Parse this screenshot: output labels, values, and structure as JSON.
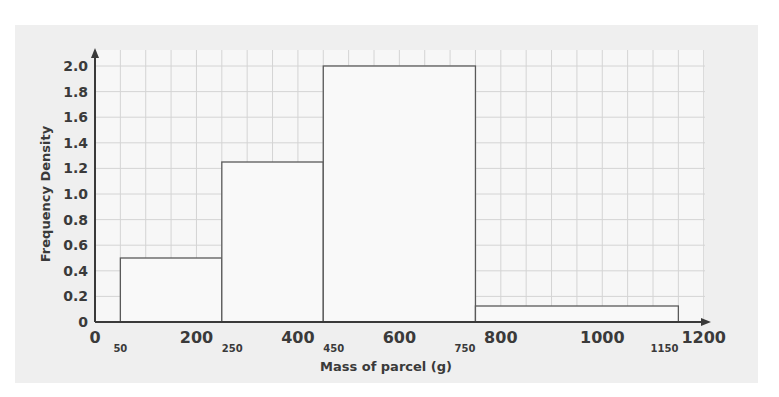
{
  "chart_data": {
    "type": "bar",
    "subtype": "histogram",
    "title": "",
    "xlabel": "Mass of parcel (g)",
    "ylabel": "Frequency Density",
    "xlim": [
      0,
      1200
    ],
    "ylim": [
      0,
      2.0
    ],
    "grid": true,
    "legend": null,
    "x_ticks": [
      0,
      200,
      400,
      600,
      800,
      1000,
      1200
    ],
    "y_ticks": [
      "0",
      "0.2",
      "0.4",
      "0.6",
      "0.8",
      "1.0",
      "1.2",
      "1.4",
      "1.6",
      "1.8",
      "2.0"
    ],
    "class_boundaries": [
      50,
      250,
      450,
      750,
      1150
    ],
    "bins": [
      {
        "from": 50,
        "to": 250,
        "frequency_density": 0.5
      },
      {
        "from": 250,
        "to": 450,
        "frequency_density": 1.25
      },
      {
        "from": 450,
        "to": 750,
        "frequency_density": 2.0
      },
      {
        "from": 750,
        "to": 1150,
        "frequency_density": 0.125
      }
    ],
    "categories": [
      "50-250",
      "250-450",
      "450-750",
      "750-1150"
    ],
    "values": [
      0.5,
      1.25,
      2.0,
      0.125
    ]
  },
  "colors": {
    "panel_bg": "#efefef",
    "plot_bg": "#f7f7f7",
    "grid": "#d4d4d4",
    "bar_fill": "#f9f9f9",
    "bar_stroke": "#5a5a5a",
    "axis": "#3a3a3a"
  }
}
